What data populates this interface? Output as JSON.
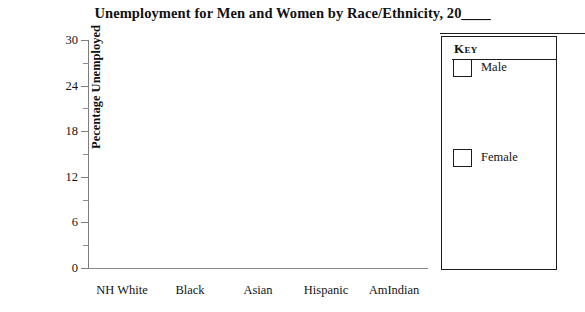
{
  "chart_data": {
    "type": "bar",
    "title": "Unemployment for Men and Women by Race/Ethnicity, 20____",
    "title_prefix": "Unemployment for Men and Women by Race/Ethnicity, 20",
    "title_year_blank": "____",
    "xlabel": "",
    "ylabel": "Pecentage Unemployed",
    "categories": [
      "NH White",
      "Black",
      "Asian",
      "Hispanic",
      "AmIndian"
    ],
    "series": [
      {
        "name": "Male",
        "values": [
          null,
          null,
          null,
          null,
          null
        ],
        "color": "#ffffff"
      },
      {
        "name": "Female",
        "values": [
          null,
          null,
          null,
          null,
          null
        ],
        "color": "#ffffff"
      }
    ],
    "ylim": [
      0,
      30
    ],
    "y_major_ticks": [
      0,
      6,
      12,
      18,
      24,
      30
    ],
    "y_major_tick_labels": [
      "0",
      "6",
      "12",
      "18",
      "24",
      "30"
    ],
    "y_minor_ticks": [
      3,
      9,
      15,
      21,
      27
    ],
    "grid": false,
    "legend_position": "right",
    "note": "blank worksheet template - no plotted data"
  },
  "legend": {
    "title": "Key",
    "entries": [
      {
        "label": "Male",
        "swatch_color": "#ffffff"
      },
      {
        "label": "Female",
        "swatch_color": "#ffffff"
      }
    ]
  },
  "colors": {
    "background": "#ffffff",
    "text": "#141414",
    "axis": "#7d7d7d",
    "key_border": "#1c1c1c"
  }
}
